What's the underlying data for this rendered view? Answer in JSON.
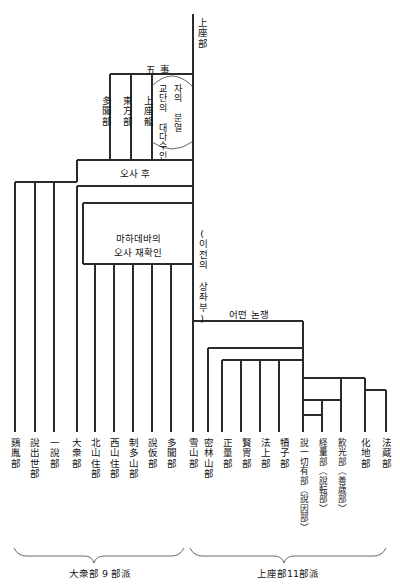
{
  "diagram": {
    "title_top": "上座部",
    "trunk_label": "(이전의 상좌부)",
    "five_points": "五  事",
    "brace_line_1": "자의 분열",
    "brace_line_2": "교단의 대다수인",
    "node_osa_hu": "오사 후",
    "node_mahadeva": "마하데바의\n오사 재확인",
    "node_mahadeva_l1": "마하데바의",
    "node_mahadeva_l2": "오사 재확인",
    "node_dispute": "어떤 논쟁",
    "upper_branches": [
      {
        "label": "多聞部"
      },
      {
        "label": "東方部"
      },
      {
        "label": "上座龍"
      }
    ],
    "summary_left": "大衆部 9 部派",
    "summary_right": "上座部11部派",
    "leaves_left": [
      {
        "label": "鷄胤部"
      },
      {
        "label": "說出世部"
      },
      {
        "label": "一說部"
      },
      {
        "label": "大衆部"
      },
      {
        "label": "北山住部"
      },
      {
        "label": "西山住部"
      },
      {
        "label": "制多山部"
      },
      {
        "label": "說仮部"
      },
      {
        "label": "多聞部"
      }
    ],
    "leaves_right": [
      {
        "label": "雪山部"
      },
      {
        "label": "密林山部"
      },
      {
        "label": "正量部"
      },
      {
        "label": "賢冑部"
      },
      {
        "label": "法上部"
      },
      {
        "label": "犢子部"
      },
      {
        "label": "說一切有部（說因部）"
      },
      {
        "label": "経量部（說転部）"
      },
      {
        "label": "飲光部（善歳部）"
      },
      {
        "label": "化地部"
      },
      {
        "label": "法蔵部"
      }
    ],
    "colors": {
      "line": "#2b2b2b",
      "thin_line": "#555555",
      "background": "#ffffff",
      "text": "#141414"
    }
  }
}
